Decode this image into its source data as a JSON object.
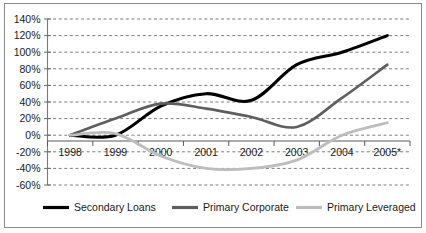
{
  "chart_data": {
    "type": "line",
    "title": "",
    "subtitle": "",
    "xlabel": "",
    "ylabel": "",
    "x": [
      "1998",
      "1999",
      "2000",
      "2001",
      "2002",
      "2003",
      "2004",
      "2005*"
    ],
    "categories": [
      "1998",
      "1999",
      "2000",
      "2001",
      "2002",
      "2003",
      "2004",
      "2005*"
    ],
    "xtick_labels": [
      "1998",
      "1999",
      "2000",
      "2001",
      "2002",
      "2003",
      "2004",
      "2005*"
    ],
    "ytick_labels": [
      "140%",
      "120%",
      "100%",
      "80%",
      "60%",
      "40%",
      "20%",
      "0%",
      "-20%",
      "-40%",
      "-60%"
    ],
    "ytick_values": [
      140,
      120,
      100,
      80,
      60,
      40,
      20,
      0,
      -20,
      -40,
      -60
    ],
    "ylim": [
      -60,
      140
    ],
    "ytick_step": 20,
    "grid": true,
    "grid_axis": "y",
    "grid_style": "dashed",
    "legend_position": "bottom",
    "series": [
      {
        "name": "Secondary Loans",
        "color": "#000000",
        "width": 3.1,
        "values": [
          0,
          0,
          35,
          50,
          42,
          85,
          100,
          120
        ]
      },
      {
        "name": "Primary Corporate",
        "color": "#5e5e5e",
        "width": 2.6,
        "values": [
          0,
          20,
          38,
          32,
          22,
          10,
          45,
          85
        ]
      },
      {
        "name": "Primary Leveraged",
        "color": "#bdbdbd",
        "width": 2.8,
        "values": [
          0,
          2,
          -25,
          -40,
          -40,
          -30,
          0,
          15
        ]
      }
    ]
  },
  "legend": {
    "items": [
      {
        "label": "Secondary Loans",
        "color": "#000000"
      },
      {
        "label": "Primary Corporate",
        "color": "#5e5e5e"
      },
      {
        "label": "Primary Leveraged",
        "color": "#bdbdbd"
      }
    ]
  },
  "axes": {
    "y_axis_color": "#7a7a7a",
    "x_axis_color": "#5a5a5a",
    "gridline_color": "#7d7d7d"
  }
}
